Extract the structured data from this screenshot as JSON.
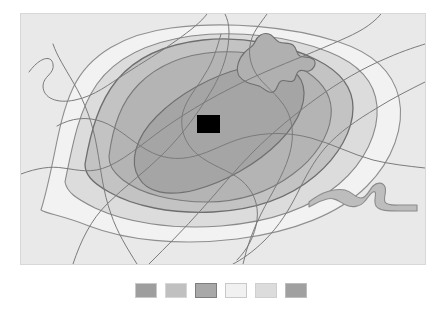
{
  "figure": {
    "type": "contour-zone-map",
    "canvas": {
      "width": 442,
      "height": 322,
      "background": "#ffffff"
    }
  },
  "map": {
    "frame": {
      "x": 20,
      "y": 13,
      "width": 404,
      "height": 250
    },
    "background_color": "#e9e9e9",
    "border_color": "#d8d8d8",
    "site_marker": {
      "name": "site-marker",
      "shape": "rectangle",
      "color": "#000000",
      "x": 176,
      "y": 101,
      "width": 23,
      "height": 18
    },
    "zones": [
      {
        "id": "zone-outer-band",
        "label": "outer zone",
        "fill": "#f2f2f2",
        "stroke": "#8f8f8f",
        "stroke_width": 1.1,
        "order": 1
      },
      {
        "id": "zone-second-band",
        "label": "second zone",
        "fill": "#dcdcdc",
        "stroke": "#8a8a8a",
        "stroke_width": 1.1,
        "order": 2
      },
      {
        "id": "zone-third-band",
        "label": "third zone",
        "fill": "#c3c3c3",
        "stroke": "#6e6e6e",
        "stroke_width": 1.3,
        "order": 3
      },
      {
        "id": "zone-fourth-band",
        "label": "fourth zone",
        "fill": "#b4b4b4",
        "stroke": "#7a7a7a",
        "stroke_width": 1.1,
        "order": 4
      },
      {
        "id": "zone-inner-core",
        "label": "inner core zone",
        "fill": "#a5a5a5",
        "stroke": "#707070",
        "stroke_width": 1.2,
        "order": 5
      }
    ],
    "features": {
      "lake_blob": {
        "name": "lake-blob",
        "fill": "#b0b0b0",
        "stroke": "#6f6f6f"
      },
      "watercourse": {
        "name": "watercourse",
        "fill": "#bdbdbd",
        "stroke": "#8b8b8b"
      },
      "roads": {
        "name": "road-network",
        "stroke": "#7b7b7b",
        "stroke_width": 1.0,
        "count": 9
      }
    }
  },
  "legend": {
    "name": "zone-legend",
    "orientation": "horizontal",
    "swatch_size": {
      "width": 22,
      "height": 15
    },
    "swatches": [
      {
        "index": 1,
        "color": "#9e9e9e",
        "border": "#c9c9c9"
      },
      {
        "index": 2,
        "color": "#c0c0c0",
        "border": "#d6d6d6"
      },
      {
        "index": 3,
        "color": "#a8a8a8",
        "border": "#7e7e7e"
      },
      {
        "index": 4,
        "color": "#f1f1f1",
        "border": "#c9c9c9"
      },
      {
        "index": 5,
        "color": "#dcdcdc",
        "border": "#cfcfcf"
      },
      {
        "index": 6,
        "color": "#a0a0a0",
        "border": "#bdbdbd"
      }
    ]
  }
}
